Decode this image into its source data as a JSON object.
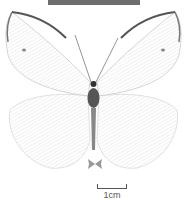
{
  "image": {
    "subject": "white butterfly specimen, dorsal view",
    "background": "#ffffff",
    "label_bar_color": "#6e6e6e"
  },
  "scale_bar": {
    "label": "1cm"
  }
}
